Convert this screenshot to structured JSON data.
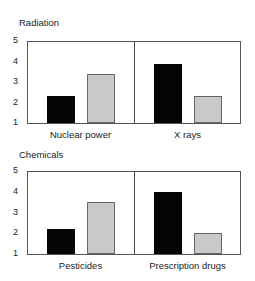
{
  "colors": {
    "series_a": "#050505",
    "series_b": "#c9c9c9",
    "frame": "#555555"
  },
  "chart_data": [
    {
      "type": "bar",
      "title": "Radiation",
      "categories": [
        "Nuclear power",
        "X rays"
      ],
      "series": [
        {
          "name": "black",
          "values": [
            2.3,
            3.9
          ]
        },
        {
          "name": "gray",
          "values": [
            3.4,
            2.3
          ]
        }
      ],
      "yticks": [
        "5",
        "4",
        "3",
        "2",
        "1"
      ],
      "ylim": [
        1,
        5
      ],
      "xlabel": "",
      "ylabel": "",
      "grid": false,
      "legend": "none"
    },
    {
      "type": "bar",
      "title": "Chemicals",
      "categories": [
        "Pesticides",
        "Prescription drugs"
      ],
      "series": [
        {
          "name": "black",
          "values": [
            2.2,
            4.0
          ]
        },
        {
          "name": "gray",
          "values": [
            3.5,
            2.0
          ]
        }
      ],
      "yticks": [
        "5",
        "4",
        "3",
        "2",
        "1"
      ],
      "ylim": [
        1,
        5
      ],
      "xlabel": "",
      "ylabel": "",
      "grid": false,
      "legend": "none"
    }
  ]
}
